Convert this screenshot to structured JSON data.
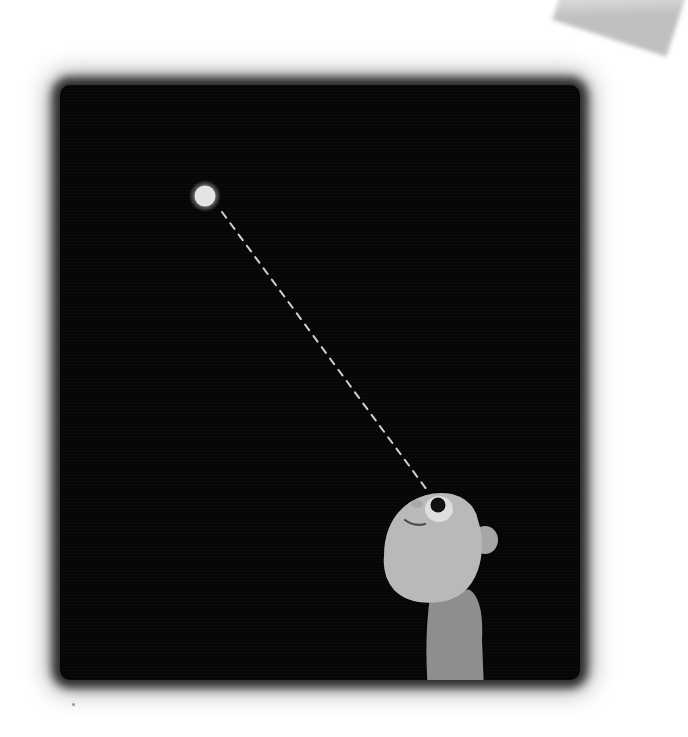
{
  "scene": {
    "description": "Illustration of a child looking up at a single star in a dark night sky, with a dashed line showing the line of sight",
    "colors": {
      "background": "#ffffff",
      "sky": "#060606",
      "star": "#e6e6e6",
      "face": "#b8b8b8",
      "body": "#8e8e8e",
      "dash_line": "#cfcfcf"
    },
    "star": {
      "x": 205,
      "y": 196,
      "radius": 11
    },
    "sight_line": {
      "from": [
        222,
        212
      ],
      "to": [
        427,
        492
      ],
      "style": "dashed"
    },
    "figure": {
      "pose": "looking-up",
      "position": "bottom-right"
    }
  }
}
